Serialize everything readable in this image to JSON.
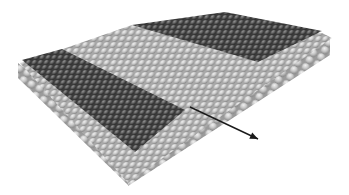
{
  "figure": {
    "width": 349,
    "height": 195,
    "colors": {
      "background": "#ffffff",
      "light_atom": "#c9c9c9",
      "light_atom_highlight": "#ececec",
      "light_atom_shadow": "#8e8e8e",
      "dark_atom": "#5a5a5a",
      "dark_atom_highlight": "#8a8a8a",
      "dark_atom_shadow": "#2e2e2e",
      "arrow": "#1a1a1a"
    },
    "regions": [
      {
        "name": "light-top-surface",
        "shade": "light",
        "points": [
          [
            20,
            63
          ],
          [
            60,
            50
          ],
          [
            132,
            25
          ],
          [
            322,
            33
          ],
          [
            332,
            38
          ],
          [
            230,
            110
          ],
          [
            128,
            183
          ]
        ]
      },
      {
        "name": "dark-top-right-patch",
        "shade": "dark",
        "points": [
          [
            132,
            25
          ],
          [
            225,
            12
          ],
          [
            322,
            31
          ],
          [
            258,
            62
          ]
        ]
      },
      {
        "name": "dark-left-strip",
        "shade": "dark",
        "points": [
          [
            22,
            60
          ],
          [
            62,
            49
          ],
          [
            185,
            110
          ],
          [
            135,
            152
          ]
        ]
      },
      {
        "name": "front-left-side-face",
        "shade": "light",
        "points": [
          [
            18,
            63
          ],
          [
            135,
            152
          ],
          [
            128,
            185
          ],
          [
            18,
            78
          ]
        ]
      },
      {
        "name": "front-right-side-face",
        "shade": "light",
        "points": [
          [
            135,
            152
          ],
          [
            330,
            38
          ],
          [
            330,
            55
          ],
          [
            128,
            186
          ]
        ]
      }
    ],
    "arrow": {
      "x1": 190,
      "y1": 107,
      "x2": 258,
      "y2": 139
    }
  }
}
